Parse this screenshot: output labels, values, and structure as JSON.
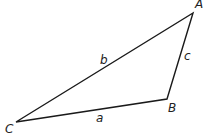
{
  "diagram": {
    "type": "triangle",
    "vertices": [
      {
        "name": "A",
        "x": 193,
        "y": 13,
        "label_x": 195,
        "label_y": 8
      },
      {
        "name": "B",
        "x": 167,
        "y": 99,
        "label_x": 168,
        "label_y": 112
      },
      {
        "name": "C",
        "x": 16,
        "y": 122,
        "label_x": 5,
        "label_y": 133
      }
    ],
    "sides": [
      {
        "name": "a",
        "from": "C",
        "to": "B",
        "label_x": 96,
        "label_y": 122
      },
      {
        "name": "b",
        "from": "C",
        "to": "A",
        "label_x": 100,
        "label_y": 64
      },
      {
        "name": "c",
        "from": "B",
        "to": "A",
        "label_x": 184,
        "label_y": 60
      }
    ],
    "stroke_color": "#1a1a1a",
    "text_color": "#222222"
  }
}
